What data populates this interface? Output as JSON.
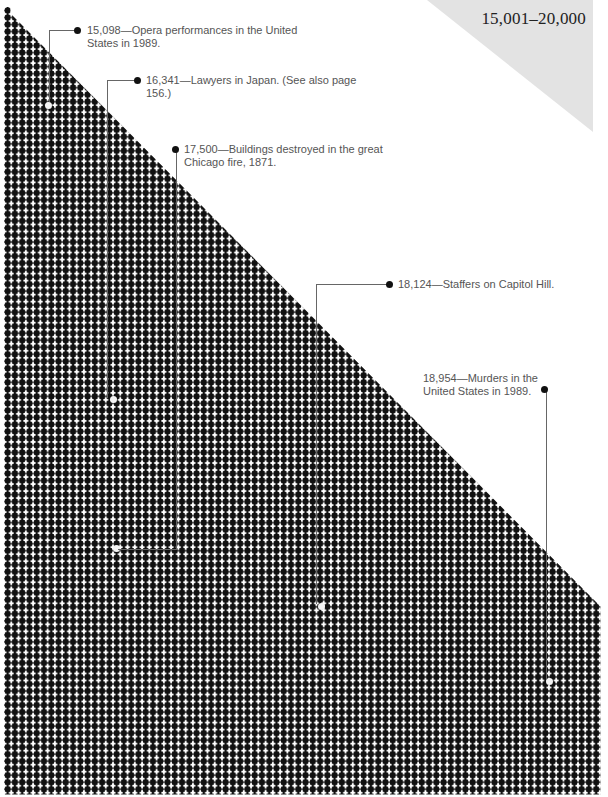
{
  "title": "15,001–20,000",
  "colors": {
    "dot": "#111111",
    "title_band": "#e3e3e3",
    "annotation_text": "#555555",
    "leader_line": "#666666"
  },
  "annotations": [
    {
      "value": "15,098",
      "text": "15,098—Opera performances in the United States in 1989.",
      "line1": "15,098—Opera performances in the United",
      "line2": "States in 1989."
    },
    {
      "value": "16,341",
      "text": "16,341—Lawyers in Japan. (See also page 156.)",
      "line1": "16,341—Lawyers in Japan. (See also page",
      "line2": "156.)"
    },
    {
      "value": "17,500",
      "text": "17,500—Buildings destroyed in the great Chicago fire, 1871.",
      "line1": "17,500—Buildings destroyed in the great",
      "line2": "Chicago fire, 1871."
    },
    {
      "value": "18,124",
      "text": "18,124—Staffers on Capitol Hill.",
      "line1": "18,124—Staffers on Capitol Hill.",
      "line2": ""
    },
    {
      "value": "18,954",
      "text": "18,954—Murders in the United States in 1989.",
      "line1": "18,954—Murders in the",
      "line2": "United States in 1989."
    }
  ]
}
